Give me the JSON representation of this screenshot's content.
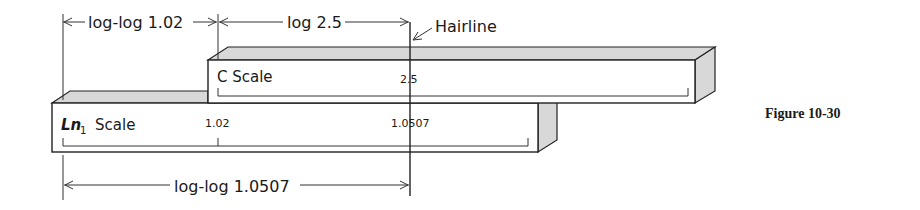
{
  "figure": {
    "caption": "Figure 10-30",
    "dimensions": {
      "top_left": "log-log 1.02",
      "top_right": "log 2.5",
      "bottom": "log-log 1.0507"
    },
    "hairline_label": "Hairline",
    "c_scale": {
      "name": "C Scale",
      "mark": "2.5"
    },
    "ln_scale": {
      "name_italic": "Ln",
      "name_sub": "1",
      "name_rest": "Scale",
      "marks": [
        "1.02",
        "1.0507"
      ]
    }
  }
}
